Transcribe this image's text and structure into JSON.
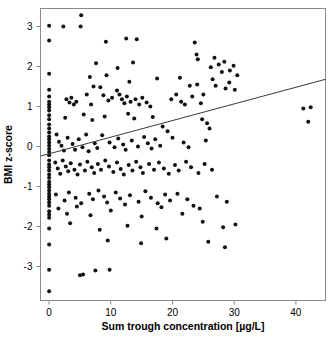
{
  "chart_data": {
    "type": "scatter",
    "title": "",
    "xlabel": "Sum trough concentration [µg/L]",
    "ylabel": "BMI z-score",
    "xlim": [
      -1.4,
      44.8
    ],
    "ylim": [
      -3.85,
      3.45
    ],
    "xticks": [
      0,
      10,
      20,
      30,
      40
    ],
    "xticklabels": [
      "0",
      "10",
      "20",
      "30",
      "40"
    ],
    "yticks": [
      3,
      2,
      1,
      0,
      -1,
      -2,
      -3
    ],
    "yticklabels": [
      "3",
      "2",
      "1",
      "0",
      "-1",
      "-2",
      "-3"
    ],
    "grid": false,
    "legend": null,
    "marker": {
      "shape": "circle",
      "size": 2.0,
      "color": "#111111"
    },
    "trendline": {
      "type": "linear",
      "color": "#3a3a3a",
      "x_start": -1.4,
      "y_start": -0.24,
      "x_end": 44.8,
      "y_end": 1.68,
      "slope": 0.0416,
      "intercept": -0.182
    },
    "n_points": 245,
    "points": [
      [
        0.0,
        3.02
      ],
      [
        2.3,
        3.0
      ],
      [
        5.1,
        3.0
      ],
      [
        5.2,
        3.28
      ],
      [
        0.0,
        2.65
      ],
      [
        9.2,
        2.62
      ],
      [
        12.5,
        2.7
      ],
      [
        14.2,
        2.68
      ],
      [
        23.6,
        2.6
      ],
      [
        0.0,
        1.82
      ],
      [
        7.6,
        2.08
      ],
      [
        11.1,
        1.96
      ],
      [
        13.6,
        2.1
      ],
      [
        23.9,
        2.3
      ],
      [
        24.1,
        2.18
      ],
      [
        0.0,
        1.42
      ],
      [
        6.6,
        1.74
      ],
      [
        9.3,
        1.78
      ],
      [
        13.0,
        1.62
      ],
      [
        17.5,
        1.7
      ],
      [
        21.2,
        1.72
      ],
      [
        22.8,
        1.52
      ],
      [
        24.0,
        1.55
      ],
      [
        7.2,
        1.5
      ],
      [
        8.3,
        1.48
      ],
      [
        11.0,
        1.4
      ],
      [
        26.2,
        1.98
      ],
      [
        26.8,
        2.22
      ],
      [
        27.5,
        2.05
      ],
      [
        28.0,
        1.86
      ],
      [
        28.4,
        2.12
      ],
      [
        29.3,
        1.9
      ],
      [
        29.9,
        2.02
      ],
      [
        30.5,
        1.78
      ],
      [
        27.0,
        1.52
      ],
      [
        28.6,
        1.45
      ],
      [
        29.2,
        1.6
      ],
      [
        30.1,
        1.42
      ],
      [
        26.5,
        1.68
      ],
      [
        0.0,
        1.25
      ],
      [
        0.0,
        1.12
      ],
      [
        0.0,
        1.05
      ],
      [
        0.0,
        0.98
      ],
      [
        0.0,
        0.9
      ],
      [
        2.8,
        1.18
      ],
      [
        3.3,
        1.1
      ],
      [
        3.6,
        1.22
      ],
      [
        4.0,
        1.05
      ],
      [
        4.4,
        1.12
      ],
      [
        6.1,
        1.3
      ],
      [
        6.8,
        1.05
      ],
      [
        8.8,
        1.28
      ],
      [
        9.6,
        1.15
      ],
      [
        10.2,
        1.22
      ],
      [
        11.4,
        1.3
      ],
      [
        11.8,
        1.18
      ],
      [
        12.2,
        1.08
      ],
      [
        12.6,
        1.25
      ],
      [
        13.2,
        1.12
      ],
      [
        14.0,
        1.18
      ],
      [
        14.6,
        1.05
      ],
      [
        15.1,
        1.22
      ],
      [
        15.8,
        1.1
      ],
      [
        16.4,
        1.0
      ],
      [
        19.8,
        1.18
      ],
      [
        20.6,
        1.3
      ],
      [
        21.4,
        1.12
      ],
      [
        22.0,
        1.05
      ],
      [
        23.2,
        1.25
      ],
      [
        24.6,
        1.08
      ],
      [
        25.0,
        1.3
      ],
      [
        41.2,
        0.95
      ],
      [
        42.4,
        0.98
      ],
      [
        42.0,
        0.62
      ],
      [
        0.0,
        0.78
      ],
      [
        0.0,
        0.68
      ],
      [
        2.6,
        0.72
      ],
      [
        5.6,
        0.8
      ],
      [
        7.0,
        0.66
      ],
      [
        9.0,
        0.75
      ],
      [
        12.8,
        0.82
      ],
      [
        13.8,
        0.7
      ],
      [
        16.8,
        0.74
      ],
      [
        24.8,
        0.68
      ],
      [
        25.6,
        0.58
      ],
      [
        26.0,
        0.45
      ],
      [
        18.4,
        0.5
      ],
      [
        19.2,
        0.38
      ],
      [
        0.0,
        0.55
      ],
      [
        0.0,
        0.45
      ],
      [
        0.0,
        0.35
      ],
      [
        0.0,
        0.25
      ],
      [
        0.0,
        0.18
      ],
      [
        0.0,
        0.1
      ],
      [
        0.0,
        0.02
      ],
      [
        0.0,
        -0.06
      ],
      [
        0.0,
        -0.14
      ],
      [
        0.0,
        -0.22
      ],
      [
        1.2,
        0.3
      ],
      [
        1.6,
        0.12
      ],
      [
        2.0,
        0.02
      ],
      [
        2.4,
        -0.1
      ],
      [
        3.0,
        0.22
      ],
      [
        3.8,
        0.06
      ],
      [
        4.2,
        -0.08
      ],
      [
        4.8,
        0.18
      ],
      [
        5.4,
        -0.02
      ],
      [
        6.0,
        0.3
      ],
      [
        6.4,
        -0.12
      ],
      [
        7.4,
        0.08
      ],
      [
        7.8,
        -0.04
      ],
      [
        8.6,
        0.28
      ],
      [
        9.8,
        0.1
      ],
      [
        10.6,
        -0.02
      ],
      [
        11.2,
        0.2
      ],
      [
        12.0,
        0.05
      ],
      [
        12.4,
        -0.08
      ],
      [
        13.4,
        0.15
      ],
      [
        14.4,
        0.0
      ],
      [
        15.4,
        0.24
      ],
      [
        16.0,
        0.08
      ],
      [
        16.6,
        -0.05
      ],
      [
        17.2,
        0.18
      ],
      [
        18.0,
        0.02
      ],
      [
        20.0,
        0.22
      ],
      [
        21.8,
        0.1
      ],
      [
        22.6,
        -0.02
      ],
      [
        25.4,
        0.15
      ],
      [
        0.0,
        -0.35
      ],
      [
        0.0,
        -0.45
      ],
      [
        0.0,
        -0.52
      ],
      [
        0.0,
        -0.6
      ],
      [
        0.0,
        -0.7
      ],
      [
        0.0,
        -0.78
      ],
      [
        0.0,
        -0.88
      ],
      [
        0.0,
        -0.95
      ],
      [
        0.0,
        -1.02
      ],
      [
        0.0,
        -1.1
      ],
      [
        1.0,
        -0.4
      ],
      [
        1.4,
        -0.55
      ],
      [
        1.8,
        -0.68
      ],
      [
        2.2,
        -0.35
      ],
      [
        2.7,
        -0.5
      ],
      [
        3.1,
        -0.62
      ],
      [
        3.5,
        -0.42
      ],
      [
        4.1,
        -0.58
      ],
      [
        4.6,
        -0.7
      ],
      [
        5.0,
        -0.45
      ],
      [
        5.8,
        -0.6
      ],
      [
        6.2,
        -0.38
      ],
      [
        6.9,
        -0.52
      ],
      [
        7.3,
        -0.66
      ],
      [
        7.9,
        -0.44
      ],
      [
        8.4,
        -0.58
      ],
      [
        9.1,
        -0.35
      ],
      [
        9.7,
        -0.5
      ],
      [
        10.4,
        -0.64
      ],
      [
        11.0,
        -0.4
      ],
      [
        11.6,
        -0.56
      ],
      [
        12.1,
        -0.7
      ],
      [
        12.9,
        -0.46
      ],
      [
        13.5,
        -0.6
      ],
      [
        14.1,
        -0.38
      ],
      [
        14.8,
        -0.52
      ],
      [
        15.2,
        -0.66
      ],
      [
        16.2,
        -0.44
      ],
      [
        17.0,
        -0.58
      ],
      [
        17.8,
        -0.4
      ],
      [
        18.6,
        -0.55
      ],
      [
        19.4,
        -0.68
      ],
      [
        20.4,
        -0.46
      ],
      [
        21.0,
        -0.6
      ],
      [
        22.2,
        -0.38
      ],
      [
        23.0,
        -0.52
      ],
      [
        24.2,
        -0.66
      ],
      [
        25.2,
        -0.44
      ],
      [
        26.4,
        -0.58
      ],
      [
        0.0,
        -1.18
      ],
      [
        0.0,
        -1.25
      ],
      [
        0.0,
        -1.32
      ],
      [
        0.0,
        -1.4
      ],
      [
        0.0,
        -1.48
      ],
      [
        1.1,
        -1.2
      ],
      [
        2.5,
        -1.35
      ],
      [
        3.2,
        -1.15
      ],
      [
        4.3,
        -1.28
      ],
      [
        5.2,
        -1.42
      ],
      [
        6.5,
        -1.18
      ],
      [
        7.1,
        -1.32
      ],
      [
        8.0,
        -1.1
      ],
      [
        8.9,
        -1.25
      ],
      [
        9.4,
        -1.4
      ],
      [
        10.8,
        -1.15
      ],
      [
        11.5,
        -1.3
      ],
      [
        12.3,
        -1.45
      ],
      [
        13.1,
        -1.22
      ],
      [
        14.5,
        -1.38
      ],
      [
        15.6,
        -1.12
      ],
      [
        16.5,
        -1.28
      ],
      [
        17.6,
        -1.42
      ],
      [
        18.8,
        -1.2
      ],
      [
        19.6,
        -1.35
      ],
      [
        20.8,
        -1.18
      ],
      [
        22.4,
        -1.32
      ],
      [
        23.4,
        -1.48
      ],
      [
        27.2,
        -1.25
      ],
      [
        28.8,
        -1.38
      ],
      [
        0.0,
        -1.62
      ],
      [
        0.0,
        -1.7
      ],
      [
        0.0,
        -1.78
      ],
      [
        1.5,
        -1.55
      ],
      [
        2.9,
        -1.68
      ],
      [
        4.5,
        -1.5
      ],
      [
        6.7,
        -1.72
      ],
      [
        10.0,
        -1.6
      ],
      [
        15.0,
        -1.75
      ],
      [
        18.2,
        -1.52
      ],
      [
        21.6,
        -1.68
      ],
      [
        24.4,
        -1.55
      ],
      [
        0.0,
        -2.05
      ],
      [
        3.4,
        -1.92
      ],
      [
        8.2,
        -2.08
      ],
      [
        12.7,
        -1.98
      ],
      [
        17.4,
        -2.05
      ],
      [
        24.9,
        -1.88
      ],
      [
        28.2,
        -2.02
      ],
      [
        30.2,
        -1.95
      ],
      [
        0.0,
        -2.45
      ],
      [
        9.5,
        -2.35
      ],
      [
        14.9,
        -2.42
      ],
      [
        19.0,
        -2.3
      ],
      [
        25.8,
        -2.38
      ],
      [
        28.5,
        -2.52
      ],
      [
        0.0,
        -3.08
      ],
      [
        5.0,
        -3.22
      ],
      [
        5.5,
        -3.2
      ],
      [
        7.5,
        -3.1
      ],
      [
        9.8,
        -3.08
      ],
      [
        0.0,
        -3.62
      ]
    ]
  },
  "figure": {
    "width": 330,
    "height": 340,
    "background": "#ffffff",
    "frame_color": "#8a8a8a",
    "axis_label_color": "#000000"
  }
}
